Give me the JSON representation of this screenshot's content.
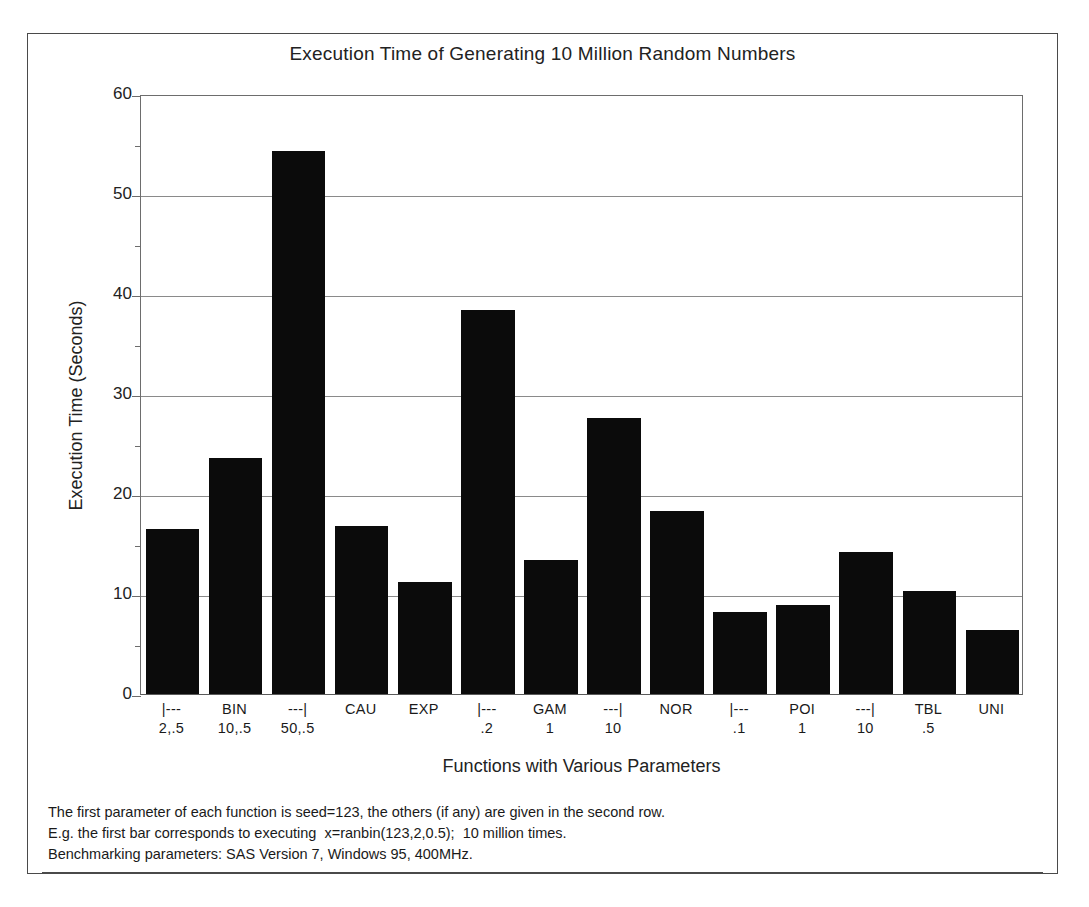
{
  "chart_data": {
    "type": "bar",
    "title": "Execution Time of Generating 10 Million Random Numbers",
    "xlabel": "Functions with Various Parameters",
    "ylabel": "Execution Time (Seconds)",
    "ylim": [
      0,
      60
    ],
    "ytick_labels": [
      "0",
      "10",
      "20",
      "30",
      "40",
      "50",
      "60"
    ],
    "ytick_values": [
      0,
      10,
      20,
      30,
      40,
      50,
      60
    ],
    "yminor_values": [
      5,
      15,
      25,
      35,
      45,
      55
    ],
    "grid": "horizontal",
    "legend": "none",
    "bar_color": "#0b0b0b",
    "categories": [
      "|---\n2,.5",
      "BIN\n10,.5",
      "---|\n50,.5",
      "CAU",
      "EXP",
      "|---\n.2",
      "GAM\n1",
      "---|\n10",
      "NOR",
      "|---\n.1",
      "POI\n1",
      "---|\n10",
      "TBL\n.5",
      "UNI"
    ],
    "values": [
      16.5,
      23.6,
      54.3,
      16.8,
      11.2,
      38.4,
      13.4,
      27.6,
      18.3,
      8.2,
      8.9,
      14.2,
      10.3,
      6.4
    ],
    "tick_labels": [
      {
        "row1": "|---",
        "row2": "2,.5"
      },
      {
        "row1": "BIN",
        "row2": "10,.5"
      },
      {
        "row1": "---|",
        "row2": "50,.5"
      },
      {
        "row1": "CAU",
        "row2": ""
      },
      {
        "row1": "EXP",
        "row2": ""
      },
      {
        "row1": "|---",
        "row2": ".2"
      },
      {
        "row1": "GAM",
        "row2": "1"
      },
      {
        "row1": "---|",
        "row2": "10"
      },
      {
        "row1": "NOR",
        "row2": ""
      },
      {
        "row1": "|---",
        "row2": ".1"
      },
      {
        "row1": "POI",
        "row2": "1"
      },
      {
        "row1": "---|",
        "row2": "10"
      },
      {
        "row1": "TBL",
        "row2": ".5"
      },
      {
        "row1": "UNI",
        "row2": ""
      }
    ]
  },
  "footnote": {
    "line1": "The first parameter of each function is seed=123, the others (if any) are given in the second row.",
    "line2": "E.g. the first bar corresponds to executing  x=ranbin(123,2,0.5);  10 million times.",
    "line3": "Benchmarking parameters: SAS Version 7, Windows 95, 400MHz."
  }
}
